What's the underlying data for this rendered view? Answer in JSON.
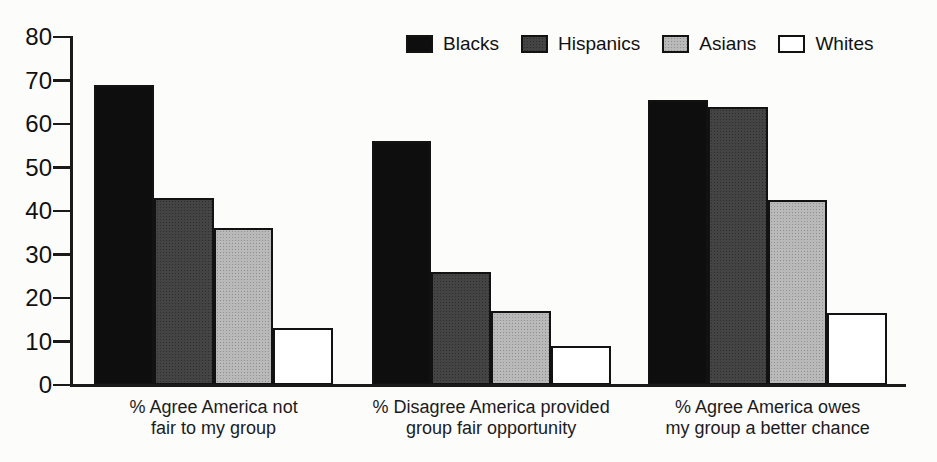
{
  "figure": {
    "background": "#fcfcfb",
    "axis_color": "#1a1a1a",
    "text_color": "#111111"
  },
  "chart_data": {
    "type": "bar",
    "title": "",
    "xlabel": "",
    "ylabel": "",
    "ylim": [
      0,
      80
    ],
    "ytick_step": 10,
    "ytick_labels": [
      "0",
      "10",
      "20",
      "30",
      "40",
      "50",
      "60",
      "70",
      "80"
    ],
    "grid": false,
    "legend_position": "top",
    "categories": [
      {
        "id": "not-fair",
        "lines": [
          "% Agree America not",
          "fair to my group"
        ]
      },
      {
        "id": "fair-opportunity",
        "lines": [
          "% Disagree America provided",
          "group fair opportunity"
        ]
      },
      {
        "id": "owes-better-chance",
        "lines": [
          "% Agree America owes",
          "my group a better chance"
        ]
      }
    ],
    "series": [
      {
        "name": "Blacks",
        "color": "#0e0e0e",
        "values": [
          69,
          56,
          65.5
        ]
      },
      {
        "name": "Hispanics",
        "color": "#3a3a3a",
        "values": [
          43,
          26,
          64
        ]
      },
      {
        "name": "Asians",
        "color": "#b5b5b5",
        "values": [
          36,
          17,
          42.5
        ]
      },
      {
        "name": "Whites",
        "color": "#ffffff",
        "values": [
          13,
          9,
          16.5
        ]
      }
    ]
  }
}
